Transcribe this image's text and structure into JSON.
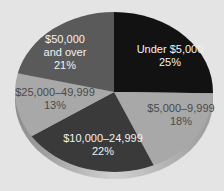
{
  "chart_data": {
    "type": "pie",
    "title": "",
    "style": "3d-tilted",
    "categories": [
      "Under $5,000",
      "$5,000–9,999",
      "$10,000–24,999",
      "$25,000–49,999",
      "$50,000 and over"
    ],
    "values": [
      25,
      18,
      22,
      13,
      21
    ],
    "unit": "%",
    "colors": [
      "#121212",
      "#a8a8a8",
      "#3a3a3a",
      "#a8a8a8",
      "#5a5a5a"
    ],
    "slices": [
      {
        "label": "Under $5,000",
        "line1": "Under $5,000",
        "line2": "",
        "pct": "25%",
        "value": 25,
        "color": "#121212",
        "text_color": "light"
      },
      {
        "label": "$5,000–9,999",
        "line1": "$5,000–9,999",
        "line2": "",
        "pct": "18%",
        "value": 18,
        "color": "#a8a8a8",
        "text_color": "dark"
      },
      {
        "label": "$10,000–24,999",
        "line1": "$10,000–24,999",
        "line2": "",
        "pct": "22%",
        "value": 22,
        "color": "#3a3a3a",
        "text_color": "light"
      },
      {
        "label": "$25,000–49,999",
        "line1": "$25,000–49,999",
        "line2": "",
        "pct": "13%",
        "value": 13,
        "color": "#a8a8a8",
        "text_color": "dark"
      },
      {
        "label": "$50,000 and over",
        "line1": "$50,000",
        "line2": "and over",
        "pct": "21%",
        "value": 21,
        "color": "#5a5a5a",
        "text_color": "light"
      }
    ],
    "legend": "none (labels inside slices)"
  }
}
